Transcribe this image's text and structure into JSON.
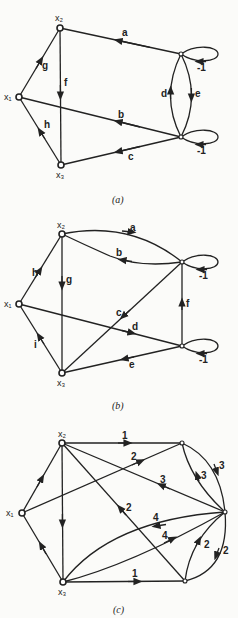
{
  "figures": [
    {
      "caption": "(a)",
      "nodes": {
        "x1": "x₁",
        "x2": "x₂",
        "x3": "x₃"
      },
      "edges": [
        {
          "label": "a",
          "from": "top-right",
          "to": "x2"
        },
        {
          "label": "b",
          "from": "bottom-right",
          "to": "x1"
        },
        {
          "label": "c",
          "from": "bottom-right",
          "to": "x3"
        },
        {
          "label": "d",
          "from": "bottom-right",
          "to": "top-right"
        },
        {
          "label": "e",
          "from": "top-right",
          "to": "bottom-right"
        },
        {
          "label": "f",
          "from": "x2",
          "to": "x3"
        },
        {
          "label": "g",
          "from": "x1",
          "to": "x2"
        },
        {
          "label": "h",
          "from": "x3",
          "to": "x1"
        }
      ],
      "self_loops": [
        "-1",
        "-1"
      ]
    },
    {
      "caption": "(b)",
      "nodes": {
        "x1": "x₁",
        "x2": "x₂",
        "x3": "x₃"
      },
      "edges": [
        {
          "label": "a",
          "from": "x2",
          "to": "top-right"
        },
        {
          "label": "b",
          "from": "top-right",
          "to": "x2"
        },
        {
          "label": "c",
          "from": "top-right",
          "to": "x3"
        },
        {
          "label": "d",
          "from": "x1",
          "to": "bottom-right"
        },
        {
          "label": "e",
          "from": "bottom-right",
          "to": "x3"
        },
        {
          "label": "f",
          "from": "bottom-right",
          "to": "top-right"
        },
        {
          "label": "g",
          "from": "x2",
          "to": "x3"
        },
        {
          "label": "h",
          "from": "x1",
          "to": "x2"
        },
        {
          "label": "i",
          "from": "x3",
          "to": "x1"
        }
      ],
      "self_loops": [
        "-1",
        "-1"
      ]
    },
    {
      "caption": "(c)",
      "nodes": {
        "x1": "x₁",
        "x2": "x₂",
        "x3": "x₃"
      },
      "edges": [
        {
          "label": "1",
          "from": "x2",
          "to": "top-right"
        },
        {
          "label": "2",
          "from": "x1",
          "to": "top-right"
        },
        {
          "label": "3",
          "from": "right",
          "to": "x2"
        },
        {
          "label": "2",
          "from": "bottom-right",
          "to": "x2"
        },
        {
          "label": "4",
          "from": "right",
          "to": "x3"
        },
        {
          "label": "4",
          "from": "x3",
          "to": "right"
        },
        {
          "label": "1",
          "from": "x3",
          "to": "bottom-right"
        },
        {
          "label": "3",
          "from": "right",
          "to": "top-right"
        },
        {
          "label": "3",
          "from": "top-right",
          "to": "right"
        },
        {
          "label": "2",
          "from": "bottom-right",
          "to": "right"
        },
        {
          "label": "2",
          "from": "right",
          "to": "bottom-right"
        }
      ]
    }
  ]
}
